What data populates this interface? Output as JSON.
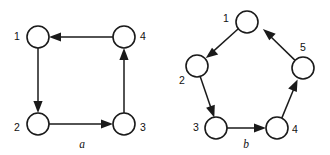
{
  "figure": {
    "background_color": "#ffffff",
    "stroke_color": "#1a1a1a",
    "node_fill_color": "#ffffff",
    "label_color": "#111111"
  },
  "graphs": [
    {
      "id": "graph-a",
      "caption": "a",
      "caption_position": {
        "x": 82,
        "y": 145
      },
      "shape": "square",
      "node_radius": 11,
      "nodes": [
        {
          "id": "a1",
          "label": "1",
          "cx": 38,
          "cy": 37,
          "label_x": 17,
          "label_y": 37
        },
        {
          "id": "a2",
          "label": "2",
          "cx": 38,
          "cy": 124,
          "label_x": 17,
          "label_y": 128
        },
        {
          "id": "a3",
          "label": "3",
          "cx": 124,
          "cy": 124,
          "label_x": 143,
          "label_y": 128
        },
        {
          "id": "a4",
          "label": "4",
          "cx": 124,
          "cy": 37,
          "label_x": 143,
          "label_y": 37
        }
      ],
      "edges": [
        {
          "id": "a-e1",
          "from": "a1",
          "to": "a2",
          "direction": "down"
        },
        {
          "id": "a-e2",
          "from": "a2",
          "to": "a3",
          "direction": "right"
        },
        {
          "id": "a-e3",
          "from": "a3",
          "to": "a4",
          "direction": "up"
        },
        {
          "id": "a-e4",
          "from": "a4",
          "to": "a1",
          "direction": "left"
        }
      ]
    },
    {
      "id": "graph-b",
      "caption": "b",
      "caption_position": {
        "x": 246,
        "y": 145
      },
      "shape": "pentagon",
      "node_radius": 11,
      "nodes": [
        {
          "id": "b1",
          "label": "1",
          "cx": 247,
          "cy": 22,
          "label_x": 226,
          "label_y": 19
        },
        {
          "id": "b2",
          "label": "2",
          "cx": 197,
          "cy": 66,
          "label_x": 182,
          "label_y": 81
        },
        {
          "id": "b3",
          "label": "3",
          "cx": 216,
          "cy": 128,
          "label_x": 196,
          "label_y": 128
        },
        {
          "id": "b4",
          "label": "4",
          "cx": 277,
          "cy": 128,
          "label_x": 295,
          "label_y": 130
        },
        {
          "id": "b5",
          "label": "5",
          "cx": 303,
          "cy": 68,
          "label_x": 303,
          "label_y": 48
        }
      ],
      "edges": [
        {
          "id": "b-e1",
          "from": "b1",
          "to": "b2",
          "direction": "down-left"
        },
        {
          "id": "b-e2",
          "from": "b2",
          "to": "b3",
          "direction": "down"
        },
        {
          "id": "b-e3",
          "from": "b3",
          "to": "b4",
          "direction": "right"
        },
        {
          "id": "b-e4",
          "from": "b4",
          "to": "b5",
          "direction": "up-right"
        },
        {
          "id": "b-e5",
          "from": "b5",
          "to": "b1",
          "direction": "up-left"
        }
      ]
    }
  ]
}
